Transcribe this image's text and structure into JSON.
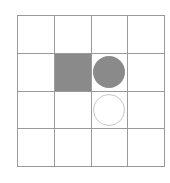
{
  "figure": {
    "grid": {
      "rows": 4,
      "columns": 4,
      "line_color": "#9a9a9a",
      "background_color": "#ffffff"
    },
    "colors": {
      "fill_gray": "#8a8a8a",
      "outline_gray": "#c9c9c9",
      "white": "#ffffff"
    },
    "cells": [
      {
        "row": 1,
        "col": 1,
        "shape": "empty",
        "label": ""
      },
      {
        "row": 1,
        "col": 2,
        "shape": "empty",
        "label": ""
      },
      {
        "row": 1,
        "col": 3,
        "shape": "empty",
        "label": ""
      },
      {
        "row": 1,
        "col": 4,
        "shape": "empty",
        "label": ""
      },
      {
        "row": 2,
        "col": 1,
        "shape": "empty",
        "label": ""
      },
      {
        "row": 2,
        "col": 2,
        "shape": "square-filled",
        "label": ""
      },
      {
        "row": 2,
        "col": 3,
        "shape": "circle-filled",
        "label": ""
      },
      {
        "row": 2,
        "col": 4,
        "shape": "empty",
        "label": ""
      },
      {
        "row": 3,
        "col": 1,
        "shape": "empty",
        "label": ""
      },
      {
        "row": 3,
        "col": 2,
        "shape": "empty",
        "label": ""
      },
      {
        "row": 3,
        "col": 3,
        "shape": "circle-outline",
        "label": ""
      },
      {
        "row": 3,
        "col": 4,
        "shape": "empty",
        "label": ""
      },
      {
        "row": 4,
        "col": 1,
        "shape": "empty",
        "label": ""
      },
      {
        "row": 4,
        "col": 2,
        "shape": "empty",
        "label": ""
      },
      {
        "row": 4,
        "col": 3,
        "shape": "empty",
        "label": ""
      },
      {
        "row": 4,
        "col": 4,
        "shape": "empty",
        "label": ""
      }
    ]
  }
}
